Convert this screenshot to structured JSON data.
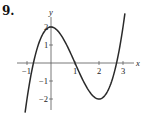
{
  "problem": {
    "number": "9."
  },
  "chart_data": {
    "type": "line",
    "title": "",
    "xlabel": "x",
    "ylabel": "y",
    "function": "y = x^3 - 3x^2 + 2",
    "x_ticks": [
      -1,
      1,
      2,
      3
    ],
    "x_tick_labels": [
      "-1",
      "1",
      "2",
      "3"
    ],
    "y_ticks": [
      -2,
      -1,
      1,
      2
    ],
    "y_tick_labels": [
      "-2",
      "-1",
      "1",
      "2"
    ],
    "xlim": [
      -1.3,
      3.6
    ],
    "ylim": [
      -2.6,
      2.9
    ],
    "grid": false,
    "series": [
      {
        "name": "curve",
        "x": [
          -1.08,
          -0.75,
          -0.5,
          -0.25,
          0,
          0.25,
          0.5,
          0.75,
          1,
          1.25,
          1.5,
          1.75,
          2,
          2.25,
          2.5,
          2.75,
          3,
          3.08
        ],
        "y": [
          -2.76,
          -0.11,
          1.13,
          1.8,
          2,
          1.83,
          1.38,
          0.73,
          0,
          -0.73,
          -1.38,
          -1.83,
          -2,
          -1.8,
          -1.13,
          0.11,
          2,
          2.75
        ]
      }
    ],
    "key_points": [
      {
        "label": "local max",
        "x": 0,
        "y": 2
      },
      {
        "label": "local min",
        "x": 2,
        "y": -2
      }
    ]
  },
  "colors": {
    "curve": "#2a2a2a",
    "axis": "#555555"
  }
}
